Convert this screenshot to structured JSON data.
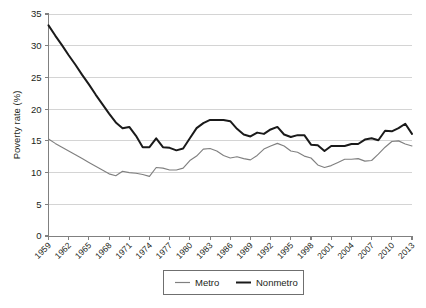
{
  "chart_data": {
    "type": "line",
    "title": "",
    "xlabel": "",
    "ylabel": "Poverty rate (%)",
    "ylim": [
      0,
      35
    ],
    "yticks": [
      0,
      5,
      10,
      15,
      20,
      25,
      30,
      35
    ],
    "ytick_labels": [
      "0",
      "5",
      "10",
      "15",
      "20",
      "25",
      "30",
      "35"
    ],
    "grid": "horizontal",
    "legend_position": "bottom-center",
    "xlim": [
      1959,
      2013
    ],
    "xtick_labels": [
      "1959",
      "1962",
      "1965",
      "1968",
      "1971",
      "1974",
      "1977",
      "1980",
      "1983",
      "1986",
      "1989",
      "1992",
      "1995",
      "1998",
      "2001",
      "2004",
      "2007",
      "2010",
      "2013"
    ],
    "x": [
      1959,
      1960,
      1961,
      1962,
      1963,
      1964,
      1965,
      1966,
      1967,
      1968,
      1969,
      1970,
      1971,
      1972,
      1973,
      1974,
      1975,
      1976,
      1977,
      1978,
      1979,
      1980,
      1981,
      1982,
      1983,
      1984,
      1985,
      1986,
      1987,
      1988,
      1989,
      1990,
      1991,
      1992,
      1993,
      1994,
      1995,
      1996,
      1997,
      1998,
      1999,
      2000,
      2001,
      2002,
      2003,
      2004,
      2005,
      2006,
      2007,
      2008,
      2009,
      2010,
      2011,
      2012,
      2013
    ],
    "series": [
      {
        "name": "Metro",
        "color": "#808080",
        "values": [
          15.3,
          14.6,
          14.0,
          13.4,
          12.8,
          12.2,
          11.6,
          11.0,
          10.4,
          9.8,
          9.5,
          10.2,
          10.0,
          9.9,
          9.7,
          9.4,
          10.8,
          10.7,
          10.4,
          10.4,
          10.7,
          11.9,
          12.6,
          13.7,
          13.8,
          13.4,
          12.7,
          12.3,
          12.5,
          12.2,
          12.0,
          12.7,
          13.7,
          14.2,
          14.6,
          14.2,
          13.4,
          13.2,
          12.6,
          12.3,
          11.2,
          10.8,
          11.1,
          11.6,
          12.1,
          12.1,
          12.2,
          11.8,
          11.9,
          12.9,
          14.0,
          14.9,
          15.0,
          14.5,
          14.2
        ]
      },
      {
        "name": "Nonmetro",
        "color": "#1a1a1a",
        "values": [
          33.2,
          31.6,
          30.1,
          28.5,
          27.0,
          25.4,
          23.9,
          22.3,
          20.8,
          19.3,
          17.9,
          17.0,
          17.2,
          15.8,
          14.0,
          14.0,
          15.4,
          14.0,
          13.9,
          13.5,
          13.8,
          15.4,
          17.0,
          17.8,
          18.3,
          18.3,
          18.3,
          18.1,
          16.9,
          16.0,
          15.7,
          16.3,
          16.1,
          16.8,
          17.2,
          16.0,
          15.6,
          15.9,
          15.9,
          14.4,
          14.3,
          13.4,
          14.2,
          14.2,
          14.2,
          14.5,
          14.5,
          15.2,
          15.4,
          15.1,
          16.6,
          16.5,
          17.0,
          17.7,
          16.1
        ]
      }
    ]
  },
  "legend": {
    "items": [
      {
        "label": "Metro",
        "color": "#808080"
      },
      {
        "label": "Nonmetro",
        "color": "#1a1a1a"
      }
    ]
  }
}
